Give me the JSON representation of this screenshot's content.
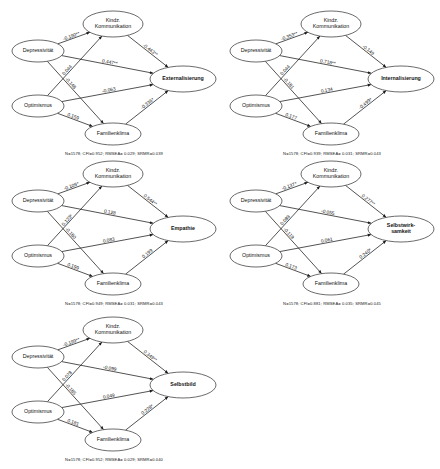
{
  "figure": {
    "node_names": {
      "depressivitaet": "Depressivität",
      "optimismus": "Optimismus",
      "kindz": "Kindz.\nKommunikation",
      "kindz_line1": "Kindz.",
      "kindz_line2": "Kommunikation",
      "familienklima": "Familienklima"
    }
  },
  "panels": [
    {
      "id": "panel-1",
      "outcome": "Externalisierung",
      "outcome_line1": "Externalisierung",
      "outcome_line2": "",
      "nodes": {
        "left_top": "Depressivität",
        "left_bottom": "Optimismus",
        "mid_top_l1": "Kindz.",
        "mid_top_l2": "Kommunikation",
        "mid_bottom": "Familienklima"
      },
      "edges": [
        {
          "name": "depressivitaet-to-kindz",
          "label": "-0.190**"
        },
        {
          "name": "depressivitaet-to-familienklima",
          "label": "-0.148"
        },
        {
          "name": "optimismus-to-kindz",
          "label": "0.044"
        },
        {
          "name": "optimismus-to-familienklima",
          "label": "0.159"
        },
        {
          "name": "depressivitaet-to-outcome",
          "label": "0.447**"
        },
        {
          "name": "optimismus-to-outcome",
          "label": "-0.063"
        },
        {
          "name": "kindz-to-outcome",
          "label": "-0.443**"
        },
        {
          "name": "familienklima-to-outcome",
          "label": "-0.336*"
        }
      ],
      "footnote": "N=1578; CFI=0.952; RMSEA= 0.029; SRMR=0.039"
    },
    {
      "id": "panel-2",
      "outcome": "Internalisierung",
      "outcome_line1": "Internalisierung",
      "outcome_line2": "",
      "nodes": {
        "left_top": "Depressivität",
        "left_bottom": "Optimismus",
        "mid_top_l1": "Kindz.",
        "mid_top_l2": "Kommunikation",
        "mid_bottom": "Familienklima"
      },
      "edges": [
        {
          "name": "depressivitaet-to-kindz",
          "label": "-0.353**"
        },
        {
          "name": "depressivitaet-to-familienklima",
          "label": "-0.181"
        },
        {
          "name": "optimismus-to-kindz",
          "label": "0.044"
        },
        {
          "name": "optimismus-to-familienklima",
          "label": "0.177"
        },
        {
          "name": "depressivitaet-to-outcome",
          "label": "0.718**"
        },
        {
          "name": "optimismus-to-outcome",
          "label": "0.134"
        },
        {
          "name": "kindz-to-outcome",
          "label": "-0.149"
        },
        {
          "name": "familienklima-to-outcome",
          "label": "-0.499*"
        }
      ],
      "footnote": "N=1578; CFI=0.939; RMSEA= 0.031; SRMR=0.043"
    },
    {
      "id": "panel-3",
      "outcome": "Empathie",
      "outcome_line1": "Empathie",
      "outcome_line2": "",
      "nodes": {
        "left_top": "Depressivität",
        "left_bottom": "Optimismus",
        "mid_top_l1": "Kindz.",
        "mid_top_l2": "Kommunikation",
        "mid_bottom": "Familienklima"
      },
      "edges": [
        {
          "name": "depressivitaet-to-kindz",
          "label": "-0.109*"
        },
        {
          "name": "depressivitaet-to-familienklima",
          "label": "-0.180"
        },
        {
          "name": "optimismus-to-kindz",
          "label": "0.123*"
        },
        {
          "name": "optimismus-to-familienklima",
          "label": "0.199"
        },
        {
          "name": "depressivitaet-to-outcome",
          "label": "0.128"
        },
        {
          "name": "optimismus-to-outcome",
          "label": "0.083"
        },
        {
          "name": "kindz-to-outcome",
          "label": "0.544**"
        },
        {
          "name": "familienklima-to-outcome",
          "label": "0.199"
        }
      ],
      "footnote": "N=1578; CFI=0.949; RMSEA= 0.031; SRMR=0.043"
    },
    {
      "id": "panel-4",
      "outcome": "Selbstwirksamkeit",
      "outcome_line1": "Selbstwirk-",
      "outcome_line2": "samkeit",
      "nodes": {
        "left_top": "Depressivität",
        "left_bottom": "Optimismus",
        "mid_top_l1": "Kindz.",
        "mid_top_l2": "Kommunikation",
        "mid_bottom": "Familienklima"
      },
      "edges": [
        {
          "name": "depressivitaet-to-kindz",
          "label": "-0.137*"
        },
        {
          "name": "depressivitaet-to-familienklima",
          "label": "-0.119"
        },
        {
          "name": "optimismus-to-kindz",
          "label": "0.089"
        },
        {
          "name": "optimismus-to-familienklima",
          "label": "0.173"
        },
        {
          "name": "depressivitaet-to-outcome",
          "label": "-0.055"
        },
        {
          "name": "optimismus-to-outcome",
          "label": "0.061"
        },
        {
          "name": "kindz-to-outcome",
          "label": "0.277**"
        },
        {
          "name": "familienklima-to-outcome",
          "label": "0.240*"
        }
      ],
      "footnote": "N=1578; CFI=0.881; RMSEA= 0.035; SRMR=0.045"
    },
    {
      "id": "panel-5",
      "outcome": "Selbstbild",
      "outcome_line1": "Selbstbild",
      "outcome_line2": "",
      "nodes": {
        "left_top": "Depressivität",
        "left_bottom": "Optimismus",
        "mid_top_l1": "Kindz.",
        "mid_top_l2": "Kommunikation",
        "mid_bottom": "Familienklima"
      },
      "edges": [
        {
          "name": "depressivitaet-to-kindz",
          "label": "-0.199**"
        },
        {
          "name": "depressivitaet-to-familienklima",
          "label": "-0.185"
        },
        {
          "name": "optimismus-to-kindz",
          "label": "0.078"
        },
        {
          "name": "optimismus-to-familienklima",
          "label": "0.181"
        },
        {
          "name": "depressivitaet-to-outcome",
          "label": "-0.099"
        },
        {
          "name": "optimismus-to-outcome",
          "label": "0.049"
        },
        {
          "name": "kindz-to-outcome",
          "label": "0.349**"
        },
        {
          "name": "familienklima-to-outcome",
          "label": "0.228*"
        }
      ],
      "footnote": "N=1578; CFI=0.952; RMSEA= 0.029; SRMR=0.040"
    }
  ],
  "chart_data": {
    "type": "diagram",
    "diagram_kind": "structural-equation-path-model",
    "panel_count": 5,
    "predictors": [
      "Depressivität",
      "Optimismus"
    ],
    "mediators": [
      "Kindz. Kommunikation",
      "Familienklima"
    ],
    "outcomes": [
      "Externalisierung",
      "Internalisierung",
      "Empathie",
      "Selbstwirksamkeit",
      "Selbstbild"
    ],
    "paths_per_panel": [
      {
        "outcome": "Externalisierung",
        "coefficients": {
          "Depressivität→Kindz. Kommunikation": -0.19,
          "Depressivität→Familienklima": -0.148,
          "Optimismus→Kindz. Kommunikation": 0.044,
          "Optimismus→Familienklima": 0.159,
          "Depressivität→Outcome": 0.447,
          "Optimismus→Outcome": -0.063,
          "Kindz. Kommunikation→Outcome": -0.443,
          "Familienklima→Outcome": -0.336
        },
        "fit": {
          "N": 1578,
          "CFI": 0.952,
          "RMSEA": 0.029,
          "SRMR": 0.039
        }
      },
      {
        "outcome": "Internalisierung",
        "coefficients": {
          "Depressivität→Kindz. Kommunikation": -0.353,
          "Depressivität→Familienklima": -0.181,
          "Optimismus→Kindz. Kommunikation": 0.044,
          "Optimismus→Familienklima": 0.177,
          "Depressivität→Outcome": 0.718,
          "Optimismus→Outcome": 0.134,
          "Kindz. Kommunikation→Outcome": -0.149,
          "Familienklima→Outcome": -0.499
        },
        "fit": {
          "N": 1578,
          "CFI": 0.939,
          "RMSEA": 0.031,
          "SRMR": 0.043
        }
      },
      {
        "outcome": "Empathie",
        "coefficients": {
          "Depressivität→Kindz. Kommunikation": -0.109,
          "Depressivität→Familienklima": -0.18,
          "Optimismus→Kindz. Kommunikation": 0.123,
          "Optimismus→Familienklima": 0.199,
          "Depressivität→Outcome": 0.128,
          "Optimismus→Outcome": 0.083,
          "Kindz. Kommunikation→Outcome": 0.544,
          "Familienklima→Outcome": 0.199
        },
        "fit": {
          "N": 1578,
          "CFI": 0.949,
          "RMSEA": 0.031,
          "SRMR": 0.043
        }
      },
      {
        "outcome": "Selbstwirksamkeit",
        "coefficients": {
          "Depressivität→Kindz. Kommunikation": -0.137,
          "Depressivität→Familienklima": -0.119,
          "Optimismus→Kindz. Kommunikation": 0.089,
          "Optimismus→Familienklima": 0.173,
          "Depressivität→Outcome": -0.055,
          "Optimismus→Outcome": 0.061,
          "Kindz. Kommunikation→Outcome": 0.277,
          "Familienklima→Outcome": 0.24
        },
        "fit": {
          "N": 1578,
          "CFI": 0.881,
          "RMSEA": 0.035,
          "SRMR": 0.045
        }
      },
      {
        "outcome": "Selbstbild",
        "coefficients": {
          "Depressivität→Kindz. Kommunikation": -0.199,
          "Depressivität→Familienklima": -0.185,
          "Optimismus→Kindz. Kommunikation": 0.078,
          "Optimismus→Familienklima": 0.181,
          "Depressivität→Outcome": -0.099,
          "Optimismus→Outcome": 0.049,
          "Kindz. Kommunikation→Outcome": 0.349,
          "Familienklima→Outcome": 0.228
        },
        "fit": {
          "N": 1578,
          "CFI": 0.952,
          "RMSEA": 0.029,
          "SRMR": 0.04
        }
      }
    ]
  }
}
